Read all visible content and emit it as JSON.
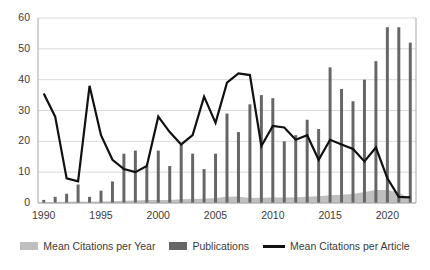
{
  "chart_data": {
    "type": "bar",
    "title": "",
    "subtitle": "",
    "xlabel": "",
    "ylabel": "",
    "grid": true,
    "legend_position": "bottom",
    "xlim": [
      1990,
      2022
    ],
    "ylim": [
      0,
      60
    ],
    "y_ticks": [
      0,
      10,
      20,
      30,
      40,
      50,
      60
    ],
    "x_ticks": [
      1990,
      1995,
      2000,
      2005,
      2010,
      2015,
      2020
    ],
    "categories": [
      1990,
      1991,
      1992,
      1993,
      1994,
      1995,
      1996,
      1997,
      1998,
      1999,
      2000,
      2001,
      2002,
      2003,
      2004,
      2005,
      2006,
      2007,
      2008,
      2009,
      2010,
      2011,
      2012,
      2013,
      2014,
      2015,
      2016,
      2017,
      2018,
      2019,
      2020,
      2021,
      2022
    ],
    "series": [
      {
        "name": "Mean Citations per Year",
        "type": "area",
        "color": "#bfbfbf",
        "values": [
          0.3,
          0.3,
          0.4,
          0.5,
          0.4,
          0.5,
          0.6,
          0.7,
          0.8,
          1.0,
          1.0,
          1.0,
          1.2,
          1.3,
          1.4,
          1.6,
          2.0,
          2.1,
          1.6,
          1.7,
          1.8,
          1.8,
          1.9,
          2.0,
          2.2,
          2.5,
          2.7,
          2.9,
          3.6,
          4.2,
          4.2,
          3.4,
          1.2
        ]
      },
      {
        "name": "Publications",
        "type": "bar",
        "color": "#666666",
        "values": [
          1,
          2,
          3,
          6,
          2,
          4,
          7,
          16,
          17,
          12,
          17,
          12,
          19,
          16,
          11,
          16,
          29,
          23,
          32,
          35,
          34,
          20,
          22,
          27,
          24,
          44,
          37,
          33,
          40,
          46,
          57,
          57,
          52
        ]
      },
      {
        "name": "Mean Citations per Article",
        "type": "line",
        "color": "#111111",
        "values": [
          35.5,
          28.0,
          8.0,
          7.0,
          38.0,
          22.0,
          14.0,
          11.0,
          10.0,
          12.0,
          28.0,
          23.0,
          19.0,
          22.0,
          34.5,
          26.0,
          39.0,
          42.0,
          41.5,
          18.5,
          25.0,
          24.5,
          20.5,
          22.0,
          14.0,
          20.5,
          19.0,
          17.5,
          13.5,
          18.0,
          8.0,
          2.0,
          1.8
        ]
      }
    ]
  },
  "axes": {
    "y_tick_labels": [
      "60",
      "50",
      "40",
      "30",
      "20",
      "10",
      "0"
    ],
    "x_tick_labels": [
      "1990",
      "1995",
      "2000",
      "2005",
      "2010",
      "2015",
      "2020"
    ]
  },
  "legend": {
    "items": [
      {
        "label": "Mean Citations per Year",
        "color": "#bfbfbf",
        "marker": "area-swatch"
      },
      {
        "label": "Publications",
        "color": "#666666",
        "marker": "bar-swatch"
      },
      {
        "label": "Mean Citations per Article",
        "color": "#111111",
        "marker": "line-swatch"
      }
    ]
  },
  "colors": {
    "area": "#bfbfbf",
    "bar": "#666666",
    "line": "#111111",
    "grid": "#d9d9d9",
    "axis": "#a6a6a6",
    "text": "#3b3b3b",
    "background": "#ffffff"
  }
}
